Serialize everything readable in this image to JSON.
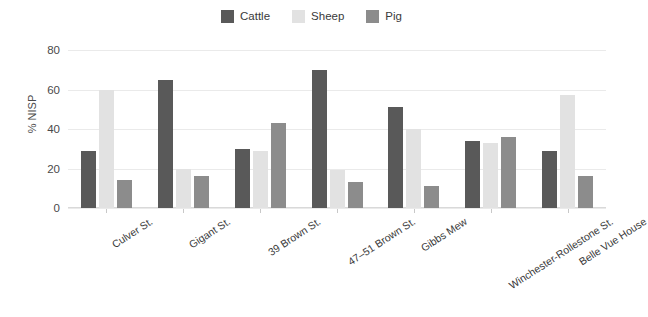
{
  "chart_data": {
    "type": "bar",
    "title": "",
    "xlabel": "",
    "ylabel": "% NISP",
    "ylim": [
      0,
      80
    ],
    "yticks": [
      0,
      20,
      40,
      60,
      80
    ],
    "grid": true,
    "legend_position": "top-center",
    "categories": [
      "Culver St.",
      "Gigant St.",
      "39 Brown St.",
      "47–51 Brown St.",
      "Gibbs Mew",
      "Winchester-Rollestone St.",
      "Belle Vue House"
    ],
    "series": [
      {
        "name": "Cattle",
        "color": "#595959",
        "values": [
          29,
          65,
          30,
          70,
          51,
          34,
          29
        ]
      },
      {
        "name": "Sheep",
        "color": "#e2e2e2",
        "values": [
          60,
          20,
          29,
          19,
          40,
          33,
          57
        ]
      },
      {
        "name": "Pig",
        "color": "#8c8c8c",
        "values": [
          14,
          16,
          43,
          13,
          11,
          36,
          16
        ]
      }
    ]
  },
  "legend": {
    "items": [
      {
        "label": "Cattle",
        "color": "#595959"
      },
      {
        "label": "Sheep",
        "color": "#e2e2e2"
      },
      {
        "label": "Pig",
        "color": "#8c8c8c"
      }
    ]
  },
  "axes": {
    "y_title": "% NISP",
    "y_ticks": [
      "80",
      "60",
      "40",
      "20",
      "0"
    ]
  }
}
